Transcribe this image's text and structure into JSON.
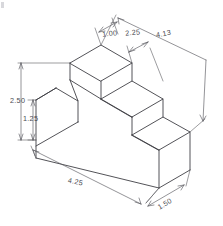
{
  "drawing": {
    "title": "Isometric Stepped Block",
    "description": "Isometric pictorial view of a three-step block with a V-groove notch in the upper left face",
    "line_color": "#3f3f45",
    "dimension_color": "#5a5a60",
    "background_color": "#ffffff"
  },
  "dimensions": [
    {
      "id": "dim-1-00",
      "label": "1.00",
      "name": "top-step-width",
      "orientation": "top-left-iso",
      "text_x": 110,
      "text_y": 36
    },
    {
      "id": "dim-2-25",
      "label": "2.25",
      "name": "upper-depth",
      "orientation": "top-iso",
      "text_x": 131,
      "text_y": 35
    },
    {
      "id": "dim-4-13",
      "label": "4.13",
      "name": "overall-diagonal-depth",
      "orientation": "right-iso",
      "text_x": 160,
      "text_y": 35
    },
    {
      "id": "dim-2-50",
      "label": "2.50",
      "name": "overall-height",
      "orientation": "vertical-left",
      "text_x": 11,
      "text_y": 101
    },
    {
      "id": "dim-1-25",
      "label": "1.25",
      "name": "base-height",
      "orientation": "vertical-left-inner",
      "text_x": 24,
      "text_y": 119
    },
    {
      "id": "dim-4-25",
      "label": "4.25",
      "name": "overall-length",
      "orientation": "bottom-iso",
      "text_x": 72,
      "text_y": 183
    },
    {
      "id": "dim-1-50",
      "label": "1.50",
      "name": "lowest-step-depth",
      "orientation": "bottom-right-iso",
      "text_x": 163,
      "text_y": 206
    }
  ],
  "geometry": {
    "type": "isometric-stepped-block",
    "step_count": 3,
    "has_notch": true,
    "notch_location": "upper-left-face"
  }
}
